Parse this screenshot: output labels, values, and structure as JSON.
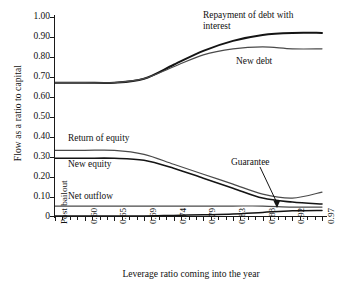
{
  "chart_data": {
    "type": "line",
    "title": "",
    "xlabel": "Leverage ratio coming into the year",
    "ylabel": "Flow as a ratio to capital",
    "ylim": [
      0,
      1.0
    ],
    "grid": false,
    "legend_position": "inline-annotations",
    "ytick_labels": [
      "1.00",
      "0.90",
      "0.80",
      "0.70",
      "0.60",
      "0.50",
      "0.40",
      "0.30",
      "0.20",
      "0.10",
      "0"
    ],
    "ytick_values": [
      1.0,
      0.9,
      0.8,
      0.7,
      0.6,
      0.5,
      0.4,
      0.3,
      0.2,
      0.1,
      0
    ],
    "categories": [
      "Post bailout",
      "0.60",
      "0.65",
      "0.69",
      "0.74",
      "0.79",
      "0.83",
      "0.88",
      "0.92",
      "0.97"
    ],
    "x": [
      0,
      1,
      2,
      3,
      4,
      5,
      6,
      7,
      8,
      9
    ],
    "series": [
      {
        "name": "Repayment of debt with interest",
        "values": [
          0.67,
          0.67,
          0.67,
          0.69,
          0.76,
          0.83,
          0.88,
          0.91,
          0.92,
          0.92
        ]
      },
      {
        "name": "New debt",
        "values": [
          0.67,
          0.67,
          0.67,
          0.69,
          0.75,
          0.81,
          0.84,
          0.85,
          0.84,
          0.84
        ]
      },
      {
        "name": "Return of equity",
        "values": [
          0.33,
          0.33,
          0.33,
          0.31,
          0.26,
          0.21,
          0.16,
          0.11,
          0.09,
          0.12
        ]
      },
      {
        "name": "New equity",
        "values": [
          0.29,
          0.29,
          0.29,
          0.28,
          0.24,
          0.19,
          0.14,
          0.09,
          0.07,
          0.06
        ]
      },
      {
        "name": "Net outflow",
        "values": [
          0.05,
          0.05,
          0.05,
          0.05,
          0.05,
          0.05,
          0.05,
          0.05,
          0.045,
          0.045
        ]
      },
      {
        "name": "Guarantee",
        "values": [
          0.0,
          0.0,
          0.0,
          0.0,
          0.003,
          0.006,
          0.01,
          0.018,
          0.026,
          0.028
        ]
      }
    ],
    "annotations": [
      {
        "text": "Repayment of debt with",
        "line2": "interest"
      },
      {
        "text": "New debt"
      },
      {
        "text": "Return of equity"
      },
      {
        "text": "New equity"
      },
      {
        "text": "Net outflow"
      },
      {
        "text": "Guarantee"
      }
    ]
  },
  "axes": {
    "y_title": "Flow as a ratio to capital",
    "x_title": "Leverage ratio coming into the year",
    "y_ticks": [
      "1.00",
      "0.90",
      "0.80",
      "0.70",
      "0.60",
      "0.50",
      "0.40",
      "0.30",
      "0.20",
      "0.10",
      "0"
    ],
    "x_ticks": [
      "Post bailout",
      "0.60",
      "0.65",
      "0.69",
      "0.74",
      "0.79",
      "0.83",
      "0.88",
      "0.92",
      "0.97"
    ]
  },
  "labels": {
    "repayment_line1": "Repayment of debt with",
    "repayment_line2": "interest",
    "new_debt": "New debt",
    "return_of_equity": "Return of equity",
    "new_equity": "New equity",
    "net_outflow": "Net outflow",
    "guarantee": "Guarantee"
  },
  "colors": {
    "line": "#1a1a1a",
    "line_light": "#555555",
    "background": "#ffffff"
  }
}
